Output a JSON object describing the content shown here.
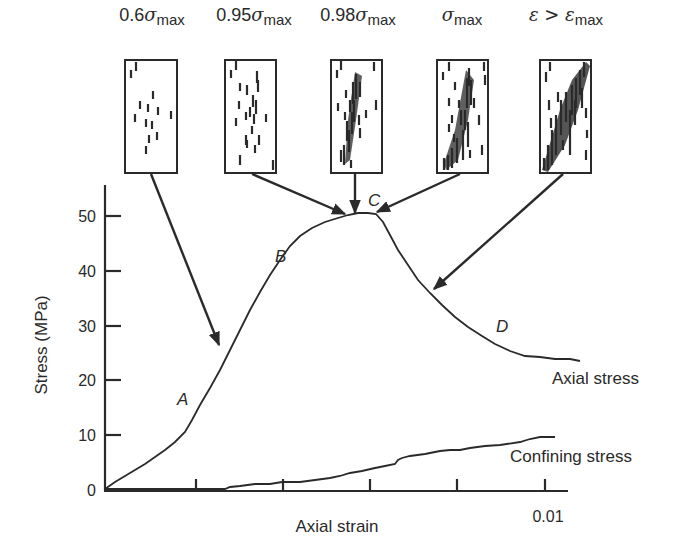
{
  "chart_data": {
    "type": "line",
    "title": "",
    "xlabel": "Axial strain",
    "ylabel": "Stress (MPa)",
    "xlim": [
      0,
      0.0105
    ],
    "ylim": [
      0,
      55
    ],
    "x_tick_labels": [
      {
        "value": 0.01,
        "label": "0.01"
      }
    ],
    "x_ticks": [
      0.002,
      0.004,
      0.006,
      0.008,
      0.01
    ],
    "y_ticks": [
      0,
      10,
      20,
      30,
      40,
      50
    ],
    "y_tick_labels": [
      "0",
      "10",
      "20",
      "30",
      "40",
      "50"
    ],
    "grid": false,
    "series": [
      {
        "name": "Axial stress",
        "x": [
          0,
          0.0005,
          0.001,
          0.0015,
          0.002,
          0.0025,
          0.003,
          0.0035,
          0.004,
          0.0045,
          0.005,
          0.0055,
          0.006,
          0.0065,
          0.007,
          0.0075,
          0.008,
          0.0085,
          0.009,
          0.0095,
          0.01,
          0.0105
        ],
        "y": [
          0,
          2.5,
          5.5,
          9,
          13.5,
          20,
          27,
          34,
          40.5,
          45.5,
          49,
          50.5,
          50.5,
          45,
          37.5,
          32,
          27.5,
          24,
          21.5,
          20,
          19.5,
          19
        ]
      },
      {
        "name": "Confining stress",
        "x": [
          0,
          0.001,
          0.002,
          0.003,
          0.0035,
          0.004,
          0.0045,
          0.005,
          0.0055,
          0.006,
          0.0065,
          0.007,
          0.0075,
          0.008,
          0.0085,
          0.009,
          0.0095,
          0.01,
          0.0104
        ],
        "y": [
          0,
          0,
          0,
          0.3,
          1,
          1.8,
          2,
          2.5,
          3.5,
          4,
          5,
          6,
          8.5,
          9.5,
          10,
          10.5,
          11,
          12.5,
          12.5
        ]
      }
    ],
    "annotations": [
      {
        "label": "A",
        "x": 0.0018,
        "y": 13,
        "desc": "onset of linear region"
      },
      {
        "label": "B",
        "x": 0.0038,
        "y": 40,
        "desc": "end of linear region"
      },
      {
        "label": "C",
        "x": 0.0061,
        "y": 50.5,
        "desc": "peak stress"
      },
      {
        "label": "D",
        "x": 0.0088,
        "y": 30,
        "desc": "post-peak softening"
      }
    ],
    "series_labels": [
      {
        "label": "Axial stress",
        "position": "right of curve near y=20"
      },
      {
        "label": "Confining stress",
        "position": "right below curve near y=7"
      }
    ],
    "inset_panels": [
      {
        "label": "0.6σmax",
        "points_to": "linear region, x≈0.0027, y≈27"
      },
      {
        "label": "0.95σmax",
        "points_to": "near peak, x≈0.0056, y≈50"
      },
      {
        "label": "0.98σmax",
        "points_to": "peak, x≈0.0058, y≈50.5"
      },
      {
        "label": "σmax",
        "points_to": "peak, x≈0.0062, y≈50.5"
      },
      {
        "label": "ε > εmax",
        "points_to": "post-peak, x≈0.0076, y≈37"
      }
    ]
  },
  "labels": {
    "xlabel": "Axial strain",
    "ylabel": "Stress (MPa)",
    "x_tick_001": "0.01",
    "y_ticks": [
      "0",
      "10",
      "20",
      "30",
      "40",
      "50"
    ],
    "point_a": "A",
    "point_b": "B",
    "point_c": "C",
    "point_d": "D",
    "axial_stress": "Axial stress",
    "confining_stress": "Confining stress"
  },
  "insets": [
    {
      "prefix": "0.6",
      "sym": "σ",
      "sub": "max"
    },
    {
      "prefix": "0.95",
      "sym": "σ",
      "sub": "max"
    },
    {
      "prefix": "0.98",
      "sym": "σ",
      "sub": "max"
    },
    {
      "prefix": "",
      "sym": "σ",
      "sub": "max"
    },
    {
      "prefix": "ε > ",
      "sym": "ε",
      "sub": "max"
    }
  ]
}
